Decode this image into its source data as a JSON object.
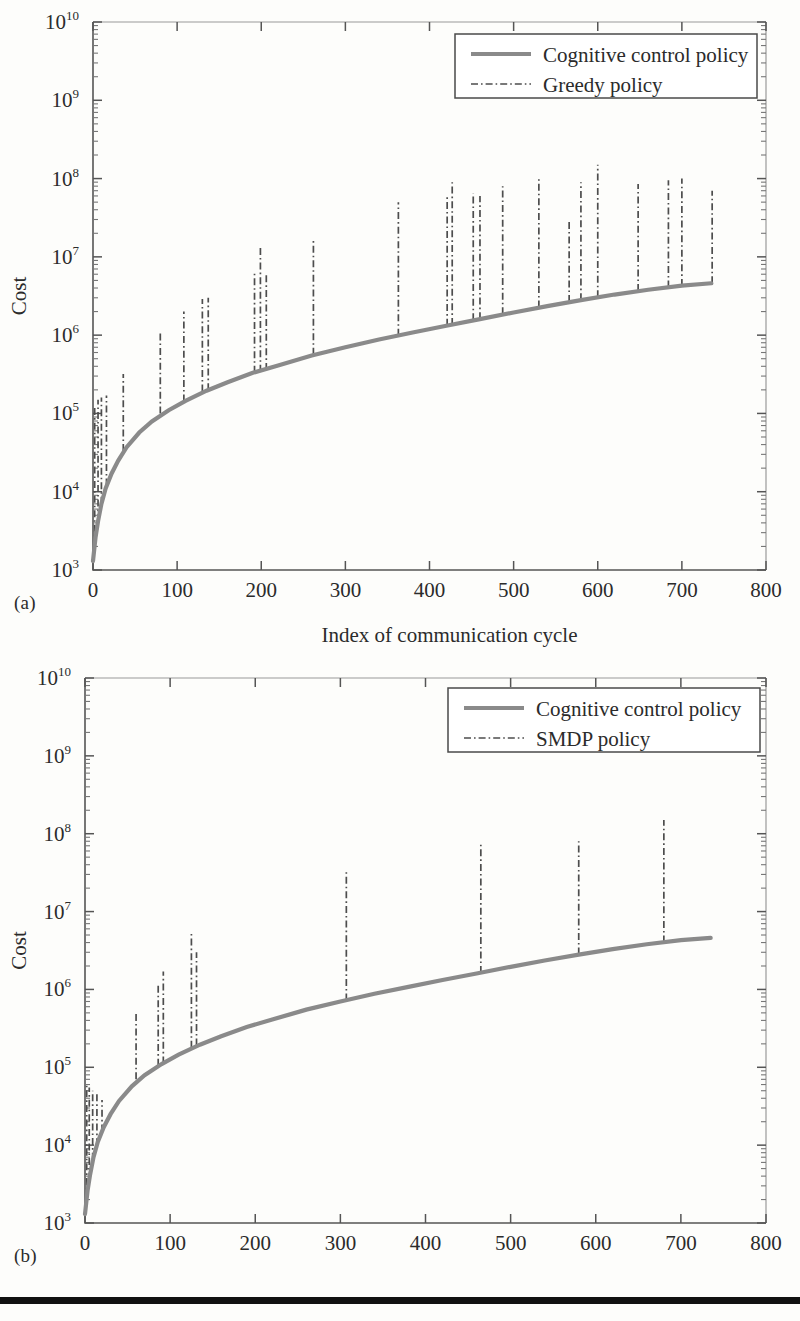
{
  "figure": {
    "panels": [
      {
        "id": "a",
        "caption": "(a)",
        "xlabel": "Index of communication cycle",
        "ylabel": "Cost",
        "legend": [
          {
            "label": "Cognitive control policy",
            "style": "solid",
            "color": "#8a8a8a"
          },
          {
            "label": "Greedy policy",
            "style": "dash-dot",
            "color": "#4d4d4d"
          }
        ]
      },
      {
        "id": "b",
        "caption": "(b)",
        "xlabel": "Index of communication cycle",
        "ylabel": "Cost",
        "legend": [
          {
            "label": "Cognitive control policy",
            "style": "solid",
            "color": "#8a8a8a"
          },
          {
            "label": "SMDP policy",
            "style": "dash-dot",
            "color": "#4d4d4d"
          }
        ]
      }
    ]
  },
  "chart_data": [
    {
      "type": "line",
      "panel": "a",
      "title": "",
      "xlabel": "Index of communication cycle",
      "ylabel": "Cost",
      "xlim": [
        0,
        800
      ],
      "ylim": [
        1000,
        10000000000
      ],
      "yscale": "log",
      "xticks": [
        0,
        100,
        200,
        300,
        400,
        500,
        600,
        700,
        800
      ],
      "yticks": [
        1000,
        10000,
        100000,
        1000000,
        10000000,
        100000000,
        1000000000,
        10000000000
      ],
      "yticklabels": [
        "10^3",
        "10^4",
        "10^5",
        "10^6",
        "10^7",
        "10^8",
        "10^9",
        "10^10"
      ],
      "grid": false,
      "legend_position": "upper right",
      "series": [
        {
          "name": "Cognitive control policy",
          "style": "solid",
          "color": "#8a8a8a",
          "x": [
            0,
            3,
            6,
            10,
            15,
            22,
            30,
            40,
            55,
            70,
            90,
            110,
            135,
            160,
            190,
            220,
            260,
            300,
            340,
            380,
            420,
            460,
            500,
            540,
            580,
            620,
            660,
            700,
            735
          ],
          "y": [
            1300,
            2600,
            4200,
            7000,
            11000,
            17000,
            25000,
            37000,
            57000,
            79000,
            110000,
            145000,
            195000,
            250000,
            330000,
            410000,
            550000,
            700000,
            880000,
            1080000,
            1320000,
            1600000,
            1950000,
            2350000,
            2800000,
            3300000,
            3800000,
            4300000,
            4600000
          ]
        },
        {
          "name": "Greedy policy",
          "style": "dash-dot",
          "color": "#4d4d4d",
          "description": "Vertical dash-dot cost spikes rising above the cognitive control curve at selected communication cycles",
          "spikes": [
            {
              "x": 2,
              "base": 2000,
              "top": 120000
            },
            {
              "x": 6,
              "base": 4200,
              "top": 150000
            },
            {
              "x": 10,
              "base": 7000,
              "top": 160000
            },
            {
              "x": 16,
              "base": 12000,
              "top": 170000
            },
            {
              "x": 36,
              "base": 33000,
              "top": 320000
            },
            {
              "x": 80,
              "base": 100000,
              "top": 1100000
            },
            {
              "x": 108,
              "base": 142000,
              "top": 2000000
            },
            {
              "x": 130,
              "base": 190000,
              "top": 2900000
            },
            {
              "x": 137,
              "base": 198000,
              "top": 3000000
            },
            {
              "x": 192,
              "base": 330000,
              "top": 6500000
            },
            {
              "x": 199,
              "base": 340000,
              "top": 13000000
            },
            {
              "x": 206,
              "base": 360000,
              "top": 6000000
            },
            {
              "x": 262,
              "base": 560000,
              "top": 16000000
            },
            {
              "x": 363,
              "base": 980000,
              "top": 50000000
            },
            {
              "x": 421,
              "base": 1320000,
              "top": 60000000
            },
            {
              "x": 427,
              "base": 1350000,
              "top": 90000000
            },
            {
              "x": 452,
              "base": 1550000,
              "top": 65000000
            },
            {
              "x": 460,
              "base": 1600000,
              "top": 60000000
            },
            {
              "x": 487,
              "base": 1850000,
              "top": 80000000
            },
            {
              "x": 530,
              "base": 2250000,
              "top": 100000000
            },
            {
              "x": 566,
              "base": 2650000,
              "top": 28000000
            },
            {
              "x": 580,
              "base": 2800000,
              "top": 90000000
            },
            {
              "x": 600,
              "base": 3050000,
              "top": 150000000
            },
            {
              "x": 648,
              "base": 3650000,
              "top": 85000000
            },
            {
              "x": 684,
              "base": 4050000,
              "top": 95000000
            },
            {
              "x": 700,
              "base": 4250000,
              "top": 100000000
            },
            {
              "x": 736,
              "base": 4600000,
              "top": 70000000
            }
          ]
        }
      ]
    },
    {
      "type": "line",
      "panel": "b",
      "title": "",
      "xlabel": "Index of communication cycle",
      "ylabel": "Cost",
      "xlim": [
        0,
        800
      ],
      "ylim": [
        1000,
        10000000000
      ],
      "yscale": "log",
      "xticks": [
        0,
        100,
        200,
        300,
        400,
        500,
        600,
        700,
        800
      ],
      "yticks": [
        1000,
        10000,
        100000,
        1000000,
        10000000,
        100000000,
        1000000000,
        10000000000
      ],
      "yticklabels": [
        "10^3",
        "10^4",
        "10^5",
        "10^6",
        "10^7",
        "10^8",
        "10^9",
        "10^10"
      ],
      "grid": false,
      "legend_position": "upper right",
      "series": [
        {
          "name": "Cognitive control policy",
          "style": "solid",
          "color": "#8a8a8a",
          "x": [
            0,
            3,
            6,
            10,
            15,
            22,
            30,
            40,
            55,
            70,
            90,
            110,
            135,
            160,
            190,
            220,
            260,
            300,
            340,
            380,
            420,
            460,
            500,
            540,
            580,
            620,
            660,
            700,
            735
          ],
          "y": [
            1300,
            2600,
            4200,
            7000,
            11000,
            17000,
            25000,
            37000,
            57000,
            79000,
            110000,
            145000,
            195000,
            250000,
            330000,
            410000,
            550000,
            700000,
            880000,
            1080000,
            1320000,
            1600000,
            1950000,
            2350000,
            2800000,
            3300000,
            3800000,
            4300000,
            4600000
          ]
        },
        {
          "name": "SMDP policy",
          "style": "dash-dot",
          "color": "#4d4d4d",
          "description": "Vertical dash-dot cost spikes rising above the cognitive control curve at selected communication cycles",
          "spikes": [
            {
              "x": 2,
              "base": 2000,
              "top": 60000
            },
            {
              "x": 5,
              "base": 3600,
              "top": 55000
            },
            {
              "x": 9,
              "base": 6500,
              "top": 50000
            },
            {
              "x": 14,
              "base": 10000,
              "top": 45000
            },
            {
              "x": 20,
              "base": 15000,
              "top": 38000
            },
            {
              "x": 60,
              "base": 70000,
              "top": 500000
            },
            {
              "x": 86,
              "base": 105000,
              "top": 1200000
            },
            {
              "x": 92,
              "base": 112000,
              "top": 1700000
            },
            {
              "x": 125,
              "base": 178000,
              "top": 5500000
            },
            {
              "x": 131,
              "base": 190000,
              "top": 3000000
            },
            {
              "x": 307,
              "base": 720000,
              "top": 34000000
            },
            {
              "x": 465,
              "base": 1620000,
              "top": 75000000
            },
            {
              "x": 580,
              "base": 2800000,
              "top": 80000000
            },
            {
              "x": 680,
              "base": 4000000,
              "top": 150000000
            }
          ]
        }
      ]
    }
  ]
}
